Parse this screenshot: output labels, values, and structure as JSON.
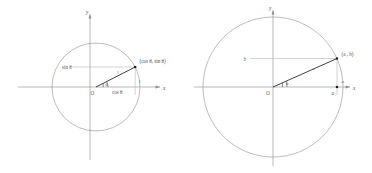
{
  "figure": {
    "background_color": "#ffffff",
    "stroke_color": "#8f8f8f",
    "radius_color": "#2b2b2b",
    "label_color": "#5a5a5a"
  },
  "diagrams": [
    {
      "id": "unit-circle",
      "name": "Unit circle with cosine and sine components",
      "center": {
        "x": 96,
        "y": 87
      },
      "radius": 44,
      "angle_degrees": 27,
      "axis_labels": {
        "x": "x",
        "y": "y"
      },
      "origin_label": "O",
      "angle_label": "θ",
      "point_label": "(cos θ, sin θ)",
      "vertical_leg_label": "sin θ",
      "horizontal_leg_label": "cos θ",
      "radius_label": "1",
      "vertical_segment_label": "1"
    },
    {
      "id": "general-circle",
      "name": "General circle with coordinates a and b",
      "center": {
        "x": 273,
        "y": 87
      },
      "radius": 70,
      "angle_degrees": 24,
      "axis_labels": {
        "x": "x",
        "y": "y"
      },
      "origin_label": "O",
      "angle_label": "θ",
      "point_label": "(a , b)",
      "vertical_leg_label": "b",
      "horizontal_leg_label": "a",
      "radius_label": "a",
      "above_axis_label": "a"
    }
  ]
}
